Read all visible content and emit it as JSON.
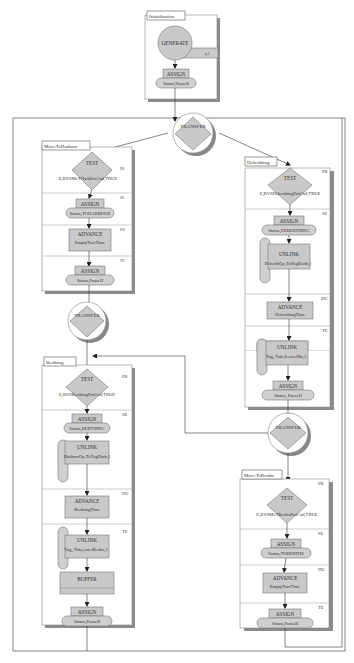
{
  "diagram": {
    "initialisation": {
      "title": "Initialisation",
      "generate": "GENERATE",
      "generate_tag": "n,1",
      "assign_label": "ASSIGN",
      "assign_value": "Status,PauseB"
    },
    "transfer_top": {
      "label": "TRANSFER"
    },
    "transfer_mid_left": {
      "label": "TRANSFER"
    },
    "transfer_mid_right": {
      "label": "TRANSFER"
    },
    "move_to_harbour": {
      "title": "MoveToHarbour",
      "phases": {
        "pr": "PR",
        "se": "SE",
        "du": "DU",
        "te": "TE"
      },
      "test_label": "TEST",
      "test_cond": "E,BVSMvTHarbProCnd,TRUE",
      "assign1_label": "ASSIGN",
      "assign1_value": "Status,TOHARBOUR",
      "advance_label": "ADVANCE",
      "advance_value": "EmptyTravTime",
      "assign2_label": "ASSIGN",
      "assign2_value": "Status,PauseH"
    },
    "deberthing": {
      "title": "Deberthing",
      "phases": {
        "pr": "PR",
        "se": "SE",
        "du": "DU",
        "te": "TE"
      },
      "test_label": "TEST",
      "test_cond": "E,BVSDeberthingProCnd,TRUE",
      "assign1_label": "ASSIGN",
      "assign1_value": "Status,DEBERTHING",
      "unlink1_label": "UNLINK",
      "unlink1_value": "DeberthQu,ToTugBerth,1",
      "advance_label": "ADVANCE",
      "advance_value": "DeberthingTime",
      "unlink2_label": "UNLINK",
      "unlink2_value": "Tug_Tokr,LeaveHbr,1",
      "assign2_label": "ASSIGN",
      "assign2_value": "Status, PauseH"
    },
    "berthing": {
      "title": "Berthing",
      "phases": {
        "pr": "PR",
        "se": "SE",
        "du": "DU",
        "te": "TE"
      },
      "test_label": "TEST",
      "test_cond": "E,BVSBerthingProCnd,TRUE",
      "assign1_label": "ASSIGN",
      "assign1_value": "Status,BERTHING",
      "unlink1_label": "UNLINK",
      "unlink1_value": "HarbourQu,ToTugHarb,1",
      "advance_label": "ADVANCE",
      "advance_value": "BerthingTime",
      "unlink2_label": "UNLINK",
      "unlink2_value": "Tug_Tokr,enterBerths,1",
      "buffer_label": "BUFFER",
      "assign2_label": "ASSIGN",
      "assign2_value": "Status,PauseB"
    },
    "move_to_berths": {
      "title": "MoveToBerths",
      "phases": {
        "pr": "PR",
        "se": "SE",
        "du": "DU",
        "te": "TE"
      },
      "test_label": "TEST",
      "test_cond": "E,BVSMvTBerthsProCnd,TRUE",
      "assign1_label": "ASSIGN",
      "assign1_value": "Status,TOBERTHS",
      "advance_label": "ADVANCE",
      "advance_value": "EmptyTravTime",
      "assign2_label": "ASSIGN",
      "assign2_value": "Status,PauseB"
    },
    "colors": {
      "block_fill": "#c9c9c9",
      "shadow": "#8c8c8c",
      "line": "#333333"
    }
  }
}
